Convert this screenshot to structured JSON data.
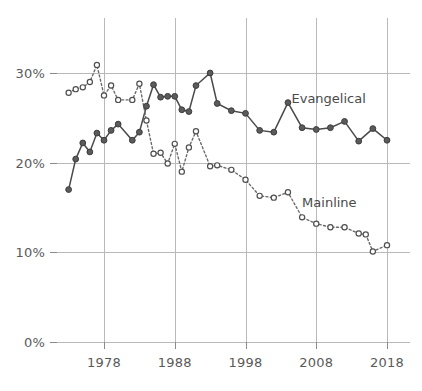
{
  "chart_data": {
    "type": "line",
    "title": "",
    "subtitle": "",
    "xlabel": "",
    "ylabel": "",
    "xlim": [
      1973,
      2018
    ],
    "ylim": [
      0,
      32
    ],
    "grid": true,
    "legend_position": "inline-right",
    "y_ticks": [
      {
        "value": 0,
        "label": "0%"
      },
      {
        "value": 10,
        "label": "10%"
      },
      {
        "value": 20,
        "label": "20%"
      },
      {
        "value": 30,
        "label": "30%"
      }
    ],
    "x_ticks": [
      {
        "value": 1978,
        "label": "1978"
      },
      {
        "value": 1988,
        "label": "1988"
      },
      {
        "value": 1998,
        "label": "1998"
      },
      {
        "value": 2008,
        "label": "2008"
      },
      {
        "value": 2018,
        "label": "2018"
      }
    ],
    "series": [
      {
        "name": "Evangelical",
        "label": "Evangelical",
        "style": "solid",
        "marker": "filled-circle",
        "color": "#4a4a4a",
        "points": [
          {
            "x": 1973,
            "y": 17.0
          },
          {
            "x": 1974,
            "y": 20.4
          },
          {
            "x": 1975,
            "y": 22.2
          },
          {
            "x": 1976,
            "y": 21.2
          },
          {
            "x": 1977,
            "y": 23.3
          },
          {
            "x": 1978,
            "y": 22.5
          },
          {
            "x": 1979,
            "y": 23.6
          },
          {
            "x": 1980,
            "y": 24.3
          },
          {
            "x": 1982,
            "y": 22.5
          },
          {
            "x": 1983,
            "y": 23.4
          },
          {
            "x": 1984,
            "y": 26.3
          },
          {
            "x": 1985,
            "y": 28.7
          },
          {
            "x": 1986,
            "y": 27.3
          },
          {
            "x": 1987,
            "y": 27.4
          },
          {
            "x": 1988,
            "y": 27.4
          },
          {
            "x": 1989,
            "y": 25.9
          },
          {
            "x": 1990,
            "y": 25.7
          },
          {
            "x": 1991,
            "y": 28.6
          },
          {
            "x": 1993,
            "y": 30.0
          },
          {
            "x": 1994,
            "y": 26.6
          },
          {
            "x": 1996,
            "y": 25.8
          },
          {
            "x": 1998,
            "y": 25.5
          },
          {
            "x": 2000,
            "y": 23.6
          },
          {
            "x": 2002,
            "y": 23.4
          },
          {
            "x": 2004,
            "y": 26.7
          },
          {
            "x": 2006,
            "y": 23.9
          },
          {
            "x": 2008,
            "y": 23.7
          },
          {
            "x": 2010,
            "y": 23.9
          },
          {
            "x": 2012,
            "y": 24.6
          },
          {
            "x": 2014,
            "y": 22.4
          },
          {
            "x": 2016,
            "y": 23.8
          },
          {
            "x": 2018,
            "y": 22.5
          }
        ]
      },
      {
        "name": "Mainline",
        "label": "Mainline",
        "style": "dotted",
        "marker": "open-circle",
        "color": "#6a6a6a",
        "points": [
          {
            "x": 1973,
            "y": 27.8
          },
          {
            "x": 1974,
            "y": 28.2
          },
          {
            "x": 1975,
            "y": 28.4
          },
          {
            "x": 1976,
            "y": 29.0
          },
          {
            "x": 1977,
            "y": 30.9
          },
          {
            "x": 1978,
            "y": 27.5
          },
          {
            "x": 1979,
            "y": 28.6
          },
          {
            "x": 1980,
            "y": 27.0
          },
          {
            "x": 1982,
            "y": 27.0
          },
          {
            "x": 1983,
            "y": 28.8
          },
          {
            "x": 1984,
            "y": 24.7
          },
          {
            "x": 1985,
            "y": 21.0
          },
          {
            "x": 1986,
            "y": 21.1
          },
          {
            "x": 1987,
            "y": 19.9
          },
          {
            "x": 1988,
            "y": 22.1
          },
          {
            "x": 1989,
            "y": 19.0
          },
          {
            "x": 1990,
            "y": 21.7
          },
          {
            "x": 1991,
            "y": 23.5
          },
          {
            "x": 1993,
            "y": 19.6
          },
          {
            "x": 1994,
            "y": 19.7
          },
          {
            "x": 1996,
            "y": 19.2
          },
          {
            "x": 1998,
            "y": 18.1
          },
          {
            "x": 2000,
            "y": 16.3
          },
          {
            "x": 2002,
            "y": 16.1
          },
          {
            "x": 2004,
            "y": 16.7
          },
          {
            "x": 2006,
            "y": 13.9
          },
          {
            "x": 2008,
            "y": 13.2
          },
          {
            "x": 2010,
            "y": 12.8
          },
          {
            "x": 2012,
            "y": 12.8
          },
          {
            "x": 2014,
            "y": 12.1
          },
          {
            "x": 2015,
            "y": 12.0
          },
          {
            "x": 2016,
            "y": 10.1
          },
          {
            "x": 2018,
            "y": 10.8
          }
        ]
      }
    ],
    "annotations": [
      {
        "name": "evangelical-label",
        "text": "Evangelical",
        "x": 2004.5,
        "y": 26.6
      },
      {
        "name": "mainline-label",
        "text": "Mainline",
        "x": 2006.0,
        "y": 15.1
      }
    ]
  }
}
